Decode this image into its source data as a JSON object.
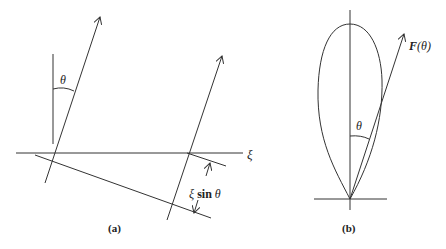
{
  "panel_a": {
    "caption": "(a)",
    "theta_label": "θ",
    "xi_label": "ξ",
    "offset_label_xi": "ξ",
    "offset_label_sin": "sin",
    "offset_label_theta": "θ"
  },
  "panel_b": {
    "caption": "(b)",
    "theta_label": "θ",
    "F_label": "F",
    "F_arg": "(θ)"
  },
  "colors": {
    "stroke": "#333333",
    "background": "#ffffff"
  }
}
